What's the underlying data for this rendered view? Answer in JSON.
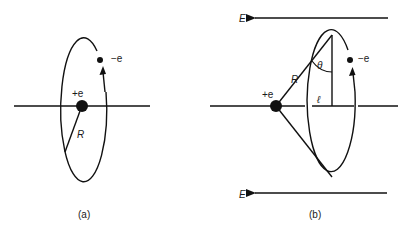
{
  "panel_a": {
    "caption": "(a)",
    "nucleus_label": "+e",
    "electron_label": "−e",
    "radius_label": "R"
  },
  "panel_b": {
    "caption": "(b)",
    "nucleus_label": "+e",
    "electron_label": "−e",
    "radius_label": "R",
    "angle_label": "θ",
    "distance_label": "ℓ",
    "field_top_label": "E",
    "field_bottom_label": "E"
  },
  "colors": {
    "ink": "#111111",
    "background": "#ffffff"
  }
}
